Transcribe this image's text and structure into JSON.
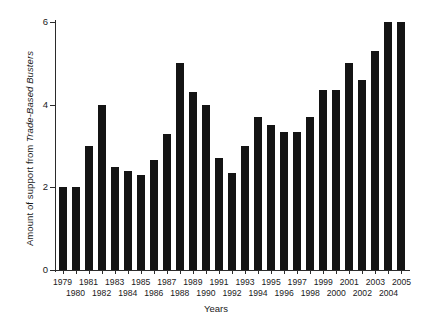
{
  "chart_data": {
    "type": "bar",
    "title": "",
    "xlabel": "Years",
    "ylabel_prefix": "Amount of support from ",
    "ylabel_italic": "Trade-Based Busters",
    "ylabel_full": "Amount of support from Trade-Based Busters",
    "categories": [
      "1979",
      "1980",
      "1981",
      "1982",
      "1983",
      "1984",
      "1985",
      "1986",
      "1987",
      "1988",
      "1989",
      "1990",
      "1991",
      "1992",
      "1993",
      "1994",
      "1995",
      "1996",
      "1997",
      "1998",
      "1999",
      "2000",
      "2001",
      "2002",
      "2003",
      "2004",
      "2005"
    ],
    "values": [
      2.0,
      2.0,
      3.0,
      4.0,
      2.5,
      2.4,
      2.3,
      2.65,
      3.3,
      5.0,
      4.3,
      4.0,
      2.7,
      2.35,
      3.0,
      3.7,
      3.5,
      3.35,
      3.35,
      3.7,
      4.35,
      4.35,
      5.0,
      4.6,
      5.3,
      6.0,
      6.0
    ],
    "ylim": [
      0,
      6
    ],
    "yticks": [
      0,
      2,
      4,
      6
    ],
    "ytick_labels": [
      "0",
      "2",
      "4",
      "6"
    ],
    "xlim_note": "27 categorical bars, one per year",
    "grid": false,
    "legend": "none",
    "bar_color": "#141414",
    "axis_color": "#2b2b2b",
    "background_color": "#ffffff"
  }
}
